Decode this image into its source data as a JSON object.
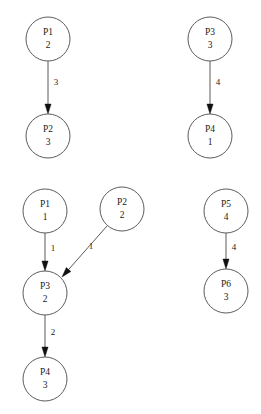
{
  "canvas": {
    "width": 261,
    "height": 414,
    "background": "#ffffff",
    "stroke_color": "#4a4a4a",
    "edge_color": "#5a5a5a",
    "arrow_color": "#111111",
    "text_color": "#1a1a1a"
  },
  "graphs": [
    {
      "id": "graph-top-left",
      "nodes": [
        {
          "id": "tl-p1",
          "name": "P1",
          "value": "2",
          "cx": 48,
          "cy": 39,
          "r": 22
        },
        {
          "id": "tl-p2",
          "name": "P2",
          "value": "3",
          "cx": 48,
          "cy": 136,
          "r": 22
        }
      ],
      "edges": [
        {
          "id": "tl-e1",
          "from": "P1",
          "to": "P2",
          "label": "3",
          "x1": 48,
          "y1": 61,
          "x2": 48,
          "y2": 114,
          "lx": 56,
          "ly": 83
        }
      ]
    },
    {
      "id": "graph-top-right",
      "nodes": [
        {
          "id": "tr-p3",
          "name": "P3",
          "value": "3",
          "cx": 210,
          "cy": 39,
          "r": 22
        },
        {
          "id": "tr-p4",
          "name": "P4",
          "value": "1",
          "cx": 210,
          "cy": 136,
          "r": 22
        }
      ],
      "edges": [
        {
          "id": "tr-e1",
          "from": "P3",
          "to": "P4",
          "label": "4",
          "x1": 210,
          "y1": 61,
          "x2": 210,
          "y2": 114,
          "lx": 218,
          "ly": 83
        }
      ]
    },
    {
      "id": "graph-bottom-left",
      "nodes": [
        {
          "id": "bl-p1",
          "name": "P1",
          "value": "1",
          "cx": 45,
          "cy": 211,
          "r": 22
        },
        {
          "id": "bl-p2",
          "name": "P2",
          "value": "2",
          "cx": 122,
          "cy": 209,
          "r": 22
        },
        {
          "id": "bl-p3",
          "name": "P3",
          "value": "2",
          "cx": 45,
          "cy": 293,
          "r": 22
        },
        {
          "id": "bl-p4",
          "name": "P4",
          "value": "3",
          "cx": 45,
          "cy": 379,
          "r": 22
        }
      ],
      "edges": [
        {
          "id": "bl-e1",
          "from": "P1",
          "to": "P3",
          "label": "1",
          "x1": 45,
          "y1": 233,
          "x2": 45,
          "y2": 271,
          "lx": 53,
          "ly": 249
        },
        {
          "id": "bl-e2",
          "from": "P2",
          "to": "P3",
          "label": "1",
          "x1": 107,
          "y1": 226,
          "x2": 62,
          "y2": 277,
          "lx": 91,
          "ly": 247
        },
        {
          "id": "bl-e3",
          "from": "P3",
          "to": "P4",
          "label": "2",
          "x1": 45,
          "y1": 315,
          "x2": 45,
          "y2": 357,
          "lx": 53,
          "ly": 333
        }
      ]
    },
    {
      "id": "graph-bottom-right",
      "nodes": [
        {
          "id": "br-p5",
          "name": "P5",
          "value": "4",
          "cx": 226,
          "cy": 211,
          "r": 22
        },
        {
          "id": "br-p6",
          "name": "P6",
          "value": "3",
          "cx": 226,
          "cy": 291,
          "r": 22
        }
      ],
      "edges": [
        {
          "id": "br-e1",
          "from": "P5",
          "to": "P6",
          "label": "4",
          "x1": 226,
          "y1": 233,
          "x2": 226,
          "y2": 269,
          "lx": 234,
          "ly": 248
        }
      ]
    }
  ]
}
